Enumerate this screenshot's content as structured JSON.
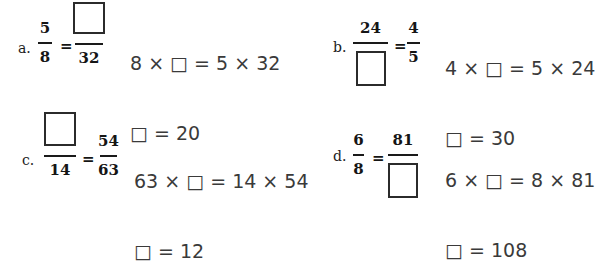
{
  "symbols": {
    "equals": "="
  },
  "problems": {
    "a": {
      "label": "a.",
      "left_num": "5",
      "left_den": "8",
      "right_den": "32",
      "eq1": "8 × □ = 5 × 32",
      "eq2": "□ = 20"
    },
    "b": {
      "label": "b.",
      "left_num": "24",
      "right_num": "4",
      "right_den": "5",
      "eq1": "4 × □ = 5 × 24",
      "eq2": "□ = 30"
    },
    "c": {
      "label": "c.",
      "left_den": "14",
      "right_num": "54",
      "right_den": "63",
      "eq1": "63 × □ = 14 × 54",
      "eq2": "□ = 12"
    },
    "d": {
      "label": "d.",
      "left_num": "6",
      "left_den": "8",
      "right_num": "81",
      "eq1": "6 × □ = 8 × 81",
      "eq2": "□ = 108"
    }
  }
}
